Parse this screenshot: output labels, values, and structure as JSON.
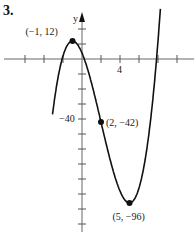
{
  "problem_number": "3.",
  "chart_data": {
    "type": "line",
    "title": "",
    "xlabel": "",
    "ylabel": "y",
    "function": "y = x^3 - 6x^2 - 15x + 4",
    "x_tick_step": 2,
    "y_tick_step": 10,
    "x_tick_labels": [
      {
        "value": 4,
        "label": "4"
      }
    ],
    "y_tick_labels": [
      {
        "value": -40,
        "label": "−40"
      }
    ],
    "xlim": [
      -6,
      10
    ],
    "ylim": [
      -120,
      35
    ],
    "grid": false,
    "points": [
      {
        "x": -1,
        "y": 12,
        "label": "(−1, 12)"
      },
      {
        "x": 2,
        "y": -42,
        "label": "(2, −42)"
      },
      {
        "x": 5,
        "y": -96,
        "label": "(5, −96)"
      }
    ],
    "color": "#111111"
  }
}
